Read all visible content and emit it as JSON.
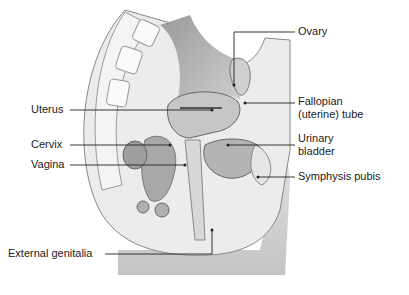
{
  "diagram": {
    "type": "anatomical-illustration",
    "labels": {
      "ovary": "Ovary",
      "fallopian_line1": "Fallopian",
      "fallopian_line2": "(uterine) tube",
      "urinary_line1": "Urinary",
      "urinary_line2": "bladder",
      "symphysis": "Symphysis pubis",
      "uterus": "Uterus",
      "cervix": "Cervix",
      "vagina": "Vagina",
      "external_genitalia": "External genitalia"
    },
    "colors": {
      "background": "#ffffff",
      "tissue_light": "#e6e6e6",
      "tissue_mid": "#bdbdbd",
      "tissue_dark": "#8a8a8a",
      "leader": "#222222"
    }
  }
}
